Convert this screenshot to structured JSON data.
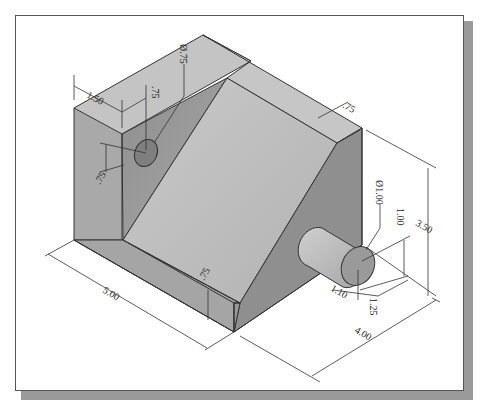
{
  "figure": {
    "type": "isometric-dimensioned-drawing",
    "colors": {
      "background": "#ffffff",
      "frame_border": "#555555",
      "shadow": "#9a9a9a",
      "face_top": "#c4c4c4",
      "face_front": "#a9a9a9",
      "face_right": "#8f8f8f",
      "face_ramp": "#bdbdbd",
      "face_inner": "#9c9c9c",
      "line": "#333333"
    }
  },
  "dimensions": {
    "top_width": "1.50",
    "hole_offset_x": ".75",
    "hole_diameter": "Ø.75",
    "hole_offset_y": ".75",
    "right_wall": ".75",
    "overall_height": "3.50",
    "boss_diameter": "Ø1.00",
    "boss_height": "1.00",
    "boss_offset": "1.25",
    "boss_length": "1.10",
    "base_thickness": ".75",
    "overall_length": "5.00",
    "overall_depth": "4.00"
  }
}
